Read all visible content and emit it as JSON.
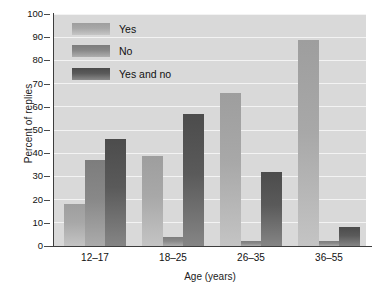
{
  "chart_data": {
    "type": "bar",
    "title": "",
    "xlabel": "Age (years)",
    "ylabel": "Percent of replies",
    "categories": [
      "12–17",
      "18–25",
      "26–35",
      "36–55"
    ],
    "series": [
      {
        "name": "Yes",
        "values": [
          18,
          39,
          66,
          89
        ],
        "color": "#a8a8a8"
      },
      {
        "name": "No",
        "values": [
          37,
          4,
          2,
          2
        ],
        "color": "#888888"
      },
      {
        "name": "Yes and no",
        "values": [
          46,
          57,
          32,
          8
        ],
        "color": "#5a5a5a"
      }
    ],
    "ylim": [
      0,
      100
    ],
    "yticks": [
      0,
      10,
      20,
      30,
      40,
      50,
      60,
      70,
      80,
      90,
      100
    ],
    "ytick_labels": [
      "0",
      "10",
      "20",
      "30",
      "40",
      "50",
      "60",
      "70",
      "80",
      "90",
      "100"
    ],
    "grid": true,
    "grid_axis": "y",
    "legend_position": "upper-left-inside",
    "plot_background": "#d9d9d9",
    "gridline_color": "#f3f3f3",
    "axis_color": "#3d3d3d"
  }
}
